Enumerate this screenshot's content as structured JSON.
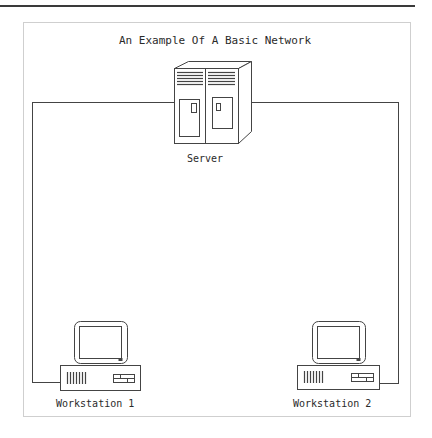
{
  "diagram": {
    "title": "An Example Of A Basic Network",
    "nodes": [
      {
        "id": "server",
        "label": "Server",
        "icon": "server-cabinet-icon"
      },
      {
        "id": "workstation1",
        "label": "Workstation 1",
        "icon": "desktop-computer-icon"
      },
      {
        "id": "workstation2",
        "label": "Workstation 2",
        "icon": "desktop-computer-icon"
      }
    ],
    "edges": [
      {
        "from": "server",
        "to": "workstation1"
      },
      {
        "from": "server",
        "to": "workstation2"
      }
    ],
    "colors": {
      "line": "#444444",
      "frame": "#cfcfcf",
      "rule": "#3a3a3a",
      "text": "#2a2a2a"
    }
  }
}
